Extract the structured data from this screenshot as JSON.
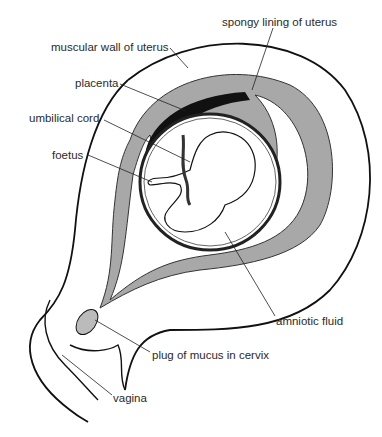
{
  "diagram": {
    "colors": {
      "background": "#ffffff",
      "line": "#111111",
      "lining": "#a8a8a8",
      "placenta": "#111111",
      "fluid": "#ffffff"
    },
    "labels": [
      {
        "id": "spongy-lining",
        "text": "spongy lining of uterus",
        "x": 222,
        "y": 17
      },
      {
        "id": "muscular-wall",
        "text": "muscular wall of uterus",
        "x": 51,
        "y": 42
      },
      {
        "id": "placenta",
        "text": "placenta",
        "x": 75,
        "y": 78
      },
      {
        "id": "umbilical-cord",
        "text": "umbilical cord",
        "x": 29,
        "y": 113
      },
      {
        "id": "foetus",
        "text": "foetus",
        "x": 52,
        "y": 150
      },
      {
        "id": "amniotic-fluid",
        "text": "amniotic fluid",
        "x": 276,
        "y": 316
      },
      {
        "id": "plug-of-mucus",
        "text": "plug of mucus in cervix",
        "x": 152,
        "y": 350
      },
      {
        "id": "vagina",
        "text": "vagina",
        "x": 113,
        "y": 393
      }
    ]
  }
}
